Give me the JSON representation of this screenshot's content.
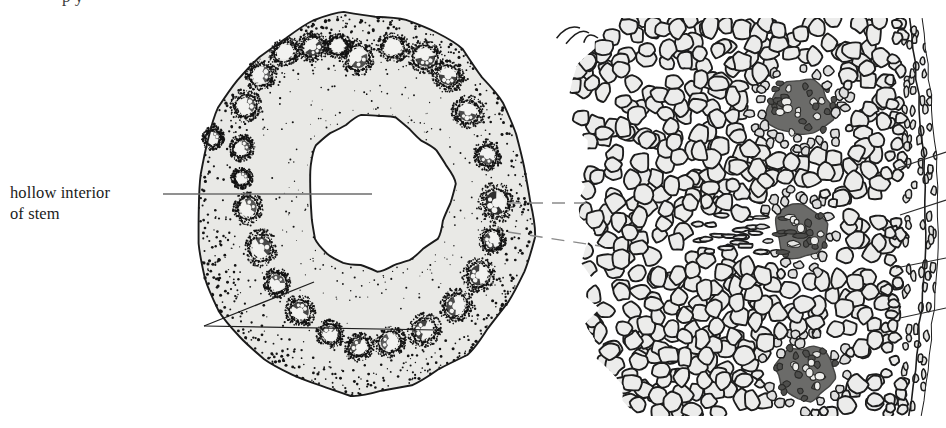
{
  "figure": {
    "kind": "botanical-line-illustration",
    "background_color": "#ffffff",
    "ink_color": "#1b1b1b",
    "cortex_fill": "#e9e9e6",
    "cell_fill": "#ececeb",
    "bundle_dark_fill": "#5a5a58",
    "leader_color": "#6d6d6d",
    "dash_color": "#8a8a8a"
  },
  "labels": {
    "hollow_interior": {
      "line1": "hollow interior",
      "line2": "of stem"
    },
    "cropped_top_fragment": "p  y"
  },
  "stem_section": {
    "name": "stem-cross-section",
    "outer_outline_center": [
      363,
      205
    ],
    "outer_radius_x": 168,
    "outer_radius_y": 190,
    "hollow_center": [
      378,
      193
    ],
    "hollow_radius_x": 72,
    "hollow_radius_y": 78,
    "vascular_bundle_count": 26,
    "bundles": [
      {
        "cx": 285,
        "cy": 52,
        "rx": 12,
        "ry": 10,
        "rot": -28,
        "dark": 0.15
      },
      {
        "cx": 313,
        "cy": 47,
        "rx": 12,
        "ry": 11,
        "rot": -18,
        "dark": 0.62
      },
      {
        "cx": 338,
        "cy": 46,
        "rx": 10,
        "ry": 9,
        "rot": -8,
        "dark": 0.1
      },
      {
        "cx": 358,
        "cy": 58,
        "rx": 12,
        "ry": 13,
        "rot": 4,
        "dark": 0.45
      },
      {
        "cx": 393,
        "cy": 47,
        "rx": 12,
        "ry": 11,
        "rot": 10,
        "dark": 0.12
      },
      {
        "cx": 425,
        "cy": 57,
        "rx": 13,
        "ry": 12,
        "rot": 18,
        "dark": 0.55
      },
      {
        "cx": 261,
        "cy": 75,
        "rx": 12,
        "ry": 11,
        "rot": -40,
        "dark": 0.32
      },
      {
        "cx": 448,
        "cy": 76,
        "rx": 12,
        "ry": 11,
        "rot": 34,
        "dark": 0.58
      },
      {
        "cx": 246,
        "cy": 106,
        "rx": 12,
        "ry": 11,
        "rot": -52,
        "dark": 0.3
      },
      {
        "cx": 468,
        "cy": 112,
        "rx": 12,
        "ry": 12,
        "rot": 48,
        "dark": 0.52
      },
      {
        "cx": 242,
        "cy": 148,
        "rx": 10,
        "ry": 9,
        "rot": -66,
        "dark": 0.3
      },
      {
        "cx": 487,
        "cy": 156,
        "rx": 11,
        "ry": 10,
        "rot": 62,
        "dark": 0.42
      },
      {
        "cx": 242,
        "cy": 178,
        "rx": 8,
        "ry": 8,
        "rot": -74,
        "dark": 0.22
      },
      {
        "cx": 496,
        "cy": 203,
        "rx": 15,
        "ry": 13,
        "rot": 78,
        "dark": 0.78
      },
      {
        "cx": 248,
        "cy": 208,
        "rx": 12,
        "ry": 11,
        "rot": -84,
        "dark": 0.38
      },
      {
        "cx": 492,
        "cy": 240,
        "rx": 11,
        "ry": 10,
        "rot": 96,
        "dark": 0.52
      },
      {
        "cx": 261,
        "cy": 248,
        "rx": 14,
        "ry": 12,
        "rot": -96,
        "dark": 0.5
      },
      {
        "cx": 479,
        "cy": 275,
        "rx": 13,
        "ry": 12,
        "rot": 108,
        "dark": 0.62
      },
      {
        "cx": 277,
        "cy": 283,
        "rx": 11,
        "ry": 10,
        "rot": -108,
        "dark": 0.35
      },
      {
        "cx": 456,
        "cy": 306,
        "rx": 13,
        "ry": 12,
        "rot": 120,
        "dark": 0.48
      },
      {
        "cx": 300,
        "cy": 311,
        "rx": 12,
        "ry": 11,
        "rot": -120,
        "dark": 0.55
      },
      {
        "cx": 424,
        "cy": 330,
        "rx": 13,
        "ry": 12,
        "rot": 134,
        "dark": 0.58
      },
      {
        "cx": 330,
        "cy": 334,
        "rx": 11,
        "ry": 10,
        "rot": -134,
        "dark": 0.28
      },
      {
        "cx": 390,
        "cy": 342,
        "rx": 12,
        "ry": 11,
        "rot": 148,
        "dark": 0.32
      },
      {
        "cx": 359,
        "cy": 347,
        "rx": 11,
        "ry": 10,
        "rot": 160,
        "dark": 0.45
      },
      {
        "cx": 213,
        "cy": 138,
        "rx": 9,
        "ry": 8,
        "rot": -60,
        "dark": 0.2
      }
    ]
  },
  "leaders": {
    "hollow_interior_line": {
      "x1": 163,
      "y1": 194,
      "x2": 372,
      "y2": 194
    },
    "bundle_pointer_vertex": [
      204,
      326
    ],
    "bundle_pointer_targets": [
      [
        314,
        282
      ],
      [
        437,
        330
      ]
    ]
  },
  "dashed_connectors": [
    {
      "x1": 508,
      "y1": 203,
      "x2": 586,
      "y2": 203
    },
    {
      "x1": 508,
      "y1": 232,
      "x2": 600,
      "y2": 246
    }
  ],
  "detail_panel": {
    "name": "magnified-tissue-detail",
    "left_edge_x": 566,
    "right_edge_x": 930,
    "top_y": 18,
    "bottom_y": 416,
    "cell_count_approx": 620,
    "epidermis_layers": 2,
    "vascular_bundles": [
      {
        "cx": 800,
        "cy": 108,
        "rx": 36,
        "ry": 30,
        "note": "upper bundle, dark sclerenchyma sheath with large vessel lumens"
      },
      {
        "cx": 800,
        "cy": 232,
        "rx": 28,
        "ry": 30,
        "note": "middle bundle, elongated with horizontal fibre band to left"
      },
      {
        "cx": 806,
        "cy": 372,
        "rx": 32,
        "ry": 28,
        "note": "lower bundle, dark with vessel lumens"
      }
    ],
    "edge_leader_lines": [
      {
        "x1": 898,
        "y1": 168,
        "x2": 946,
        "y2": 152
      },
      {
        "x1": 900,
        "y1": 215,
        "x2": 946,
        "y2": 200
      },
      {
        "x1": 896,
        "y1": 268,
        "x2": 946,
        "y2": 258
      },
      {
        "x1": 900,
        "y1": 318,
        "x2": 946,
        "y2": 308
      }
    ]
  }
}
